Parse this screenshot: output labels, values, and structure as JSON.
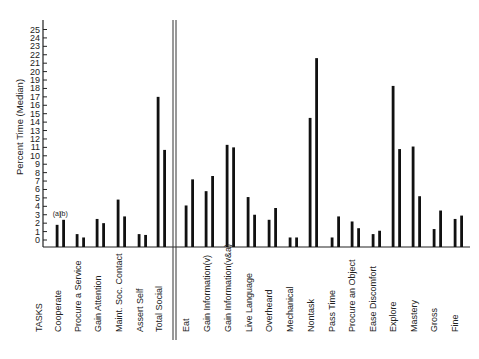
{
  "chart_data": {
    "type": "bar",
    "title": "",
    "xlabel": "TASKS",
    "ylabel": "Percent Time (Median)",
    "ylim": [
      0,
      25
    ],
    "yticks": [
      0,
      1,
      2,
      3,
      4,
      5,
      6,
      7,
      8,
      9,
      10,
      11,
      12,
      13,
      14,
      15,
      16,
      17,
      18,
      19,
      20,
      21,
      22,
      23,
      24,
      25
    ],
    "grid": false,
    "legend": null,
    "annotations": [
      "(a)",
      "(b)"
    ],
    "groups": [
      {
        "name": "Social",
        "categories": [
          "Cooperate",
          "Procure a Service",
          "Gain Attention",
          "Maint. Soc. Contact",
          "Assert Self",
          "Total Social"
        ]
      },
      {
        "name": "Nonsocial",
        "categories": [
          "Eat",
          "Gain Information(v)",
          "Gain Information(v&a)",
          "Live Language",
          "Overheard",
          "Mechanical",
          "Nontask",
          "Pass Time",
          "Procure an Object",
          "Ease Discomfort",
          "Explore",
          "Mastery",
          "Gross",
          "Fine"
        ]
      }
    ],
    "categories": [
      "Cooperate",
      "Procure a Service",
      "Gain Attention",
      "Maint. Soc. Contact",
      "Assert Self",
      "Total Social",
      "Eat",
      "Gain Information(v)",
      "Gain Information(v&a)",
      "Live Language",
      "Overheard",
      "Mechanical",
      "Nontask",
      "Pass Time",
      "Procure an Object",
      "Ease Discomfort",
      "Explore",
      "Mastery",
      "Gross",
      "Fine"
    ],
    "series": [
      {
        "name": "(a)",
        "values": [
          1.8,
          0.7,
          2.5,
          4.8,
          0.7,
          17.0,
          4.1,
          5.8,
          11.3,
          5.1,
          2.4,
          0.3,
          14.5,
          0.3,
          2.2,
          0.7,
          18.3,
          11.1,
          1.3,
          2.5
        ]
      },
      {
        "name": "(b)",
        "values": [
          2.4,
          0.3,
          2.0,
          2.8,
          0.6,
          10.7,
          7.2,
          7.6,
          11.0,
          3.0,
          3.8,
          0.3,
          21.6,
          2.8,
          1.4,
          1.1,
          10.8,
          5.2,
          3.5,
          2.9
        ]
      }
    ]
  },
  "layout_hint": {
    "bar_x_a": [
      57,
      77,
      97,
      118,
      139,
      158,
      186,
      206,
      227,
      248,
      269,
      290,
      310,
      332,
      352,
      373,
      393,
      413,
      434,
      455
    ],
    "label_x": [
      61,
      81,
      101,
      122,
      143,
      162,
      189,
      210,
      231,
      252,
      272,
      293,
      314,
      335,
      355,
      376,
      396,
      417,
      437,
      458
    ]
  }
}
